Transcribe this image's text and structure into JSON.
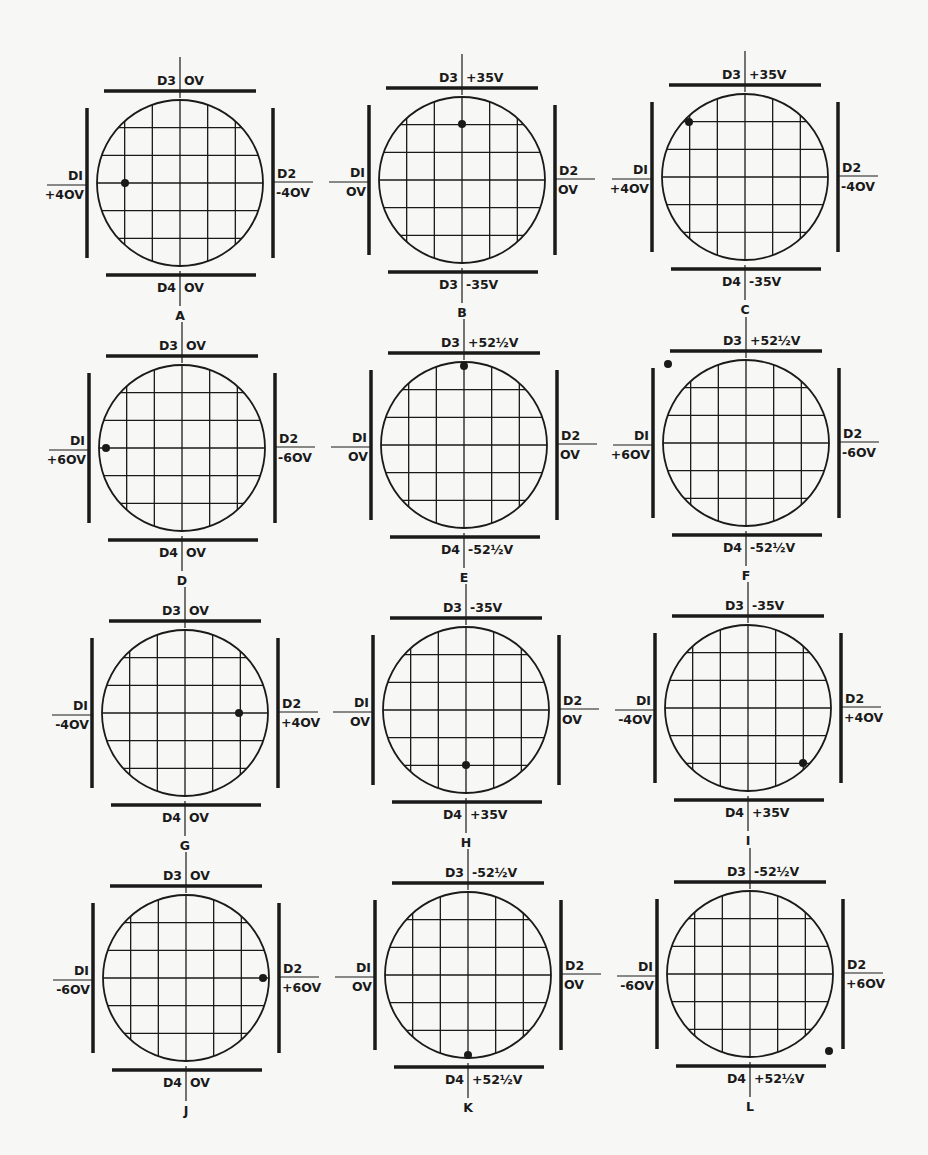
{
  "figure": {
    "ink_color": "#1a1a1a",
    "paper_color": "#f7f7f5",
    "grid": {
      "divisions": 6,
      "radius": 83
    },
    "panels": [
      {
        "id": "A",
        "cx": 180,
        "cy": 183,
        "d1": "+40V",
        "d2": "-40V",
        "top_plate": "D3",
        "top": "0V",
        "bottom_plate": "D4",
        "bottom": "0V",
        "dot": [
          125,
          183
        ]
      },
      {
        "id": "B",
        "cx": 462,
        "cy": 180,
        "d1": "0V",
        "d2": "0V",
        "top_plate": "D3",
        "top": "+35V",
        "bottom_plate": "D3",
        "bottom": "-35V",
        "dot": [
          462,
          124
        ]
      },
      {
        "id": "C",
        "cx": 745,
        "cy": 177,
        "d1": "+40V",
        "d2": "-40V",
        "top_plate": "D3",
        "top": "+35V",
        "bottom_plate": "D4",
        "bottom": "-35V",
        "dot": [
          689,
          122
        ]
      },
      {
        "id": "D",
        "cx": 182,
        "cy": 448,
        "d1": "+60V",
        "d2": "-60V",
        "top_plate": "D3",
        "top": "0V",
        "bottom_plate": "D4",
        "bottom": "0V",
        "dot": [
          106,
          448
        ]
      },
      {
        "id": "E",
        "cx": 464,
        "cy": 445,
        "d1": "0V",
        "d2": "0V",
        "top_plate": "D3",
        "top": "+52 1/2V",
        "bottom_plate": "D4",
        "bottom": "-52 1/2V",
        "dot": [
          464,
          366
        ]
      },
      {
        "id": "F",
        "cx": 746,
        "cy": 443,
        "d1": "+60V",
        "d2": "-60V",
        "top_plate": "D3",
        "top": "+52 1/2V",
        "bottom_plate": "D4",
        "bottom": "-52 1/2V",
        "dot": [
          668,
          364
        ]
      },
      {
        "id": "G",
        "cx": 185,
        "cy": 713,
        "d1": "-40V",
        "d2": "+40V",
        "top_plate": "D3",
        "top": "0V",
        "bottom_plate": "D4",
        "bottom": "0V",
        "dot": [
          239,
          713
        ]
      },
      {
        "id": "H",
        "cx": 466,
        "cy": 710,
        "d1": "0V",
        "d2": "0V",
        "top_plate": "D3",
        "top": "-35V",
        "bottom_plate": "D4",
        "bottom": "+35V",
        "dot": [
          466,
          765
        ]
      },
      {
        "id": "I",
        "cx": 748,
        "cy": 708,
        "d1": "-40V",
        "d2": "+40V",
        "top_plate": "D3",
        "top": "-35V",
        "bottom_plate": "D4",
        "bottom": "+35V",
        "dot": [
          803,
          763
        ]
      },
      {
        "id": "J",
        "cx": 186,
        "cy": 978,
        "d1": "-60V",
        "d2": "+60V",
        "top_plate": "D3",
        "top": "0V",
        "bottom_plate": "D4",
        "bottom": "0V",
        "dot": [
          263,
          978
        ]
      },
      {
        "id": "K",
        "cx": 468,
        "cy": 975,
        "d1": "0V",
        "d2": "0V",
        "top_plate": "D3",
        "top": "-52 1/2V",
        "bottom_plate": "D4",
        "bottom": "+52 1/2V",
        "dot": [
          468,
          1055
        ]
      },
      {
        "id": "L",
        "cx": 750,
        "cy": 974,
        "d1": "-60V",
        "d2": "+60V",
        "top_plate": "D3",
        "top": "-52 1/2V",
        "bottom_plate": "D4",
        "bottom": "+52 1/2V",
        "dot": [
          829,
          1051
        ]
      }
    ]
  },
  "plate_labels": {
    "left": "DI",
    "right": "D2"
  }
}
